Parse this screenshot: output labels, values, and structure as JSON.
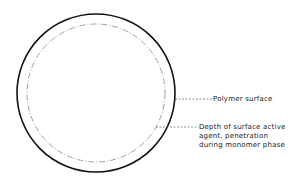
{
  "diagram": {
    "labels": {
      "polymer_surface": "Polymer surface",
      "depth_line1": "Depth of surface active",
      "depth_line2": "agent, penetration",
      "depth_line3": "during monomer phase"
    },
    "colors": {
      "line": "#111111",
      "dashed": "#888888"
    }
  }
}
